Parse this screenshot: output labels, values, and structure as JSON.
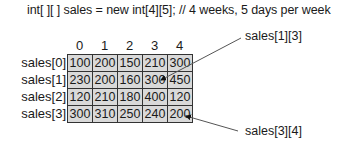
{
  "code_line": "int[ ][ ] sales = new int[4][5]; // 4 weeks, 5 days per week",
  "column_indices": [
    "0",
    "1",
    "2",
    "3",
    "4"
  ],
  "row_labels": [
    "sales[0]",
    "sales[1]",
    "sales[2]",
    "sales[3]"
  ],
  "rows": [
    [
      "100",
      "200",
      "150",
      "210",
      "300"
    ],
    [
      "230",
      "200",
      "160",
      "300",
      "450"
    ],
    [
      "120",
      "210",
      "180",
      "400",
      "120"
    ],
    [
      "300",
      "310",
      "250",
      "240",
      "200"
    ]
  ],
  "callouts": {
    "top": "sales[1][3]",
    "bottom": "sales[3][4]"
  },
  "colors": {
    "cell_fill": "#d9d9d9",
    "cell_border": "#333333",
    "arrow": "#555555"
  }
}
